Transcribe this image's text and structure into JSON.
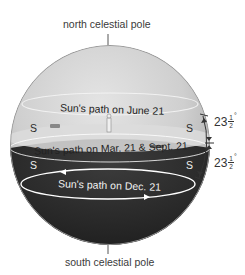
{
  "labels": {
    "north_pole": "north celestial pole",
    "south_pole": "south celestial pole",
    "june_path": "Sun's path on June 21",
    "equinox_path": "Sun's path on Mar. 21 & Sept. 21",
    "dec_path": "Sun's path on Dec. 21"
  },
  "horizon_marks": {
    "upper_left": "S",
    "upper_right": "S",
    "lower_left": "S",
    "lower_right": "S"
  },
  "angles": [
    {
      "whole": "23",
      "num": "1",
      "den": "2",
      "unit": "°"
    },
    {
      "whole": "23",
      "num": "1",
      "den": "2",
      "unit": "°"
    }
  ],
  "colors": {
    "sky_light": "#d6d6d6",
    "sky_mid": "#bdbdbd",
    "below_horizon": "#2b2b2b",
    "path_line": "#ffffff"
  }
}
